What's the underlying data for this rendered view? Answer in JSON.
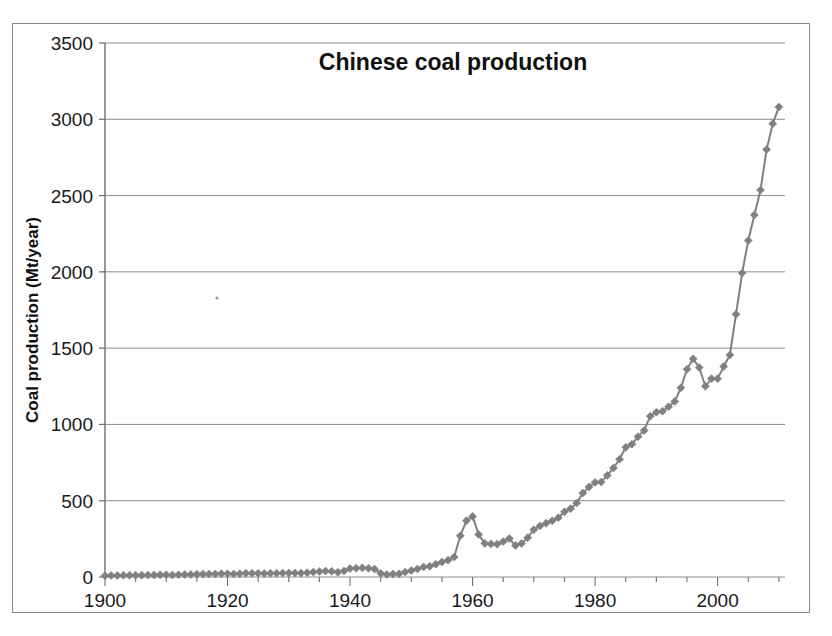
{
  "figure": {
    "background_color": "#ffffff",
    "frame_color": "#8a8a8a"
  },
  "chart_data": {
    "type": "line",
    "title": "Chinese coal production",
    "subtitle": "",
    "xlabel": "",
    "ylabel": "Coal production (Mt/year)",
    "xlim": [
      1900,
      2011
    ],
    "ylim": [
      0,
      3500
    ],
    "ytick_values": [
      0,
      500,
      1000,
      1500,
      2000,
      2500,
      3000,
      3500
    ],
    "ytick_labels": [
      "0",
      "500",
      "1000",
      "1500",
      "2000",
      "2500",
      "3000",
      "3500"
    ],
    "xtick_values": [
      1900,
      1920,
      1940,
      1960,
      1980,
      2000
    ],
    "xtick_labels": [
      "1900",
      "1920",
      "1940",
      "1960",
      "1980",
      "2000"
    ],
    "x_minor_tick_interval": 5,
    "grid": "horizontal",
    "legend": "none",
    "series_color": "#808080",
    "marker": "diamond",
    "marker_size": 4,
    "line_width": 2,
    "series": [
      {
        "name": "Chinese coal production",
        "units": "Mt/year",
        "x": [
          1900,
          1901,
          1902,
          1903,
          1904,
          1905,
          1906,
          1907,
          1908,
          1909,
          1910,
          1911,
          1912,
          1913,
          1914,
          1915,
          1916,
          1917,
          1918,
          1919,
          1920,
          1921,
          1922,
          1923,
          1924,
          1925,
          1926,
          1927,
          1928,
          1929,
          1930,
          1931,
          1932,
          1933,
          1934,
          1935,
          1936,
          1937,
          1938,
          1939,
          1940,
          1941,
          1942,
          1943,
          1944,
          1945,
          1946,
          1947,
          1948,
          1949,
          1950,
          1951,
          1952,
          1953,
          1954,
          1955,
          1956,
          1957,
          1958,
          1959,
          1960,
          1961,
          1962,
          1963,
          1964,
          1965,
          1966,
          1967,
          1968,
          1969,
          1970,
          1971,
          1972,
          1973,
          1974,
          1975,
          1976,
          1977,
          1978,
          1979,
          1980,
          1981,
          1982,
          1983,
          1984,
          1985,
          1986,
          1987,
          1988,
          1989,
          1990,
          1991,
          1992,
          1993,
          1994,
          1995,
          1996,
          1997,
          1998,
          1999,
          2000,
          2001,
          2002,
          2003,
          2004,
          2005,
          2006,
          2007,
          2008,
          2009,
          2010
        ],
        "values": [
          9,
          10,
          10,
          11,
          11,
          12,
          12,
          13,
          13,
          14,
          14,
          13,
          15,
          16,
          17,
          18,
          19,
          19,
          20,
          21,
          21,
          20,
          22,
          24,
          24,
          24,
          23,
          24,
          25,
          26,
          26,
          27,
          26,
          28,
          32,
          36,
          39,
          37,
          31,
          40,
          55,
          57,
          60,
          57,
          52,
          24,
          16,
          19,
          21,
          32,
          43,
          53,
          66,
          70,
          84,
          98,
          110,
          131,
          270,
          369,
          397,
          278,
          220,
          217,
          215,
          232,
          252,
          206,
          220,
          258,
          310,
          335,
          352,
          368,
          389,
          427,
          448,
          485,
          550,
          590,
          620,
          622,
          666,
          715,
          772,
          850,
          870,
          920,
          960,
          1054,
          1080,
          1087,
          1116,
          1150,
          1240,
          1361,
          1430,
          1373,
          1250,
          1300,
          1300,
          1380,
          1455,
          1722,
          1992,
          2205,
          2373,
          2536,
          2802,
          2971,
          3080
        ],
        "annotations": [
          {
            "label": "Great Leap Forward peak",
            "x": 1960,
            "y": 397
          },
          {
            "label": "1996 local peak",
            "x": 1996,
            "y": 1430
          },
          {
            "label": "2010 final value",
            "x": 2010,
            "y": 3080
          }
        ]
      }
    ]
  }
}
